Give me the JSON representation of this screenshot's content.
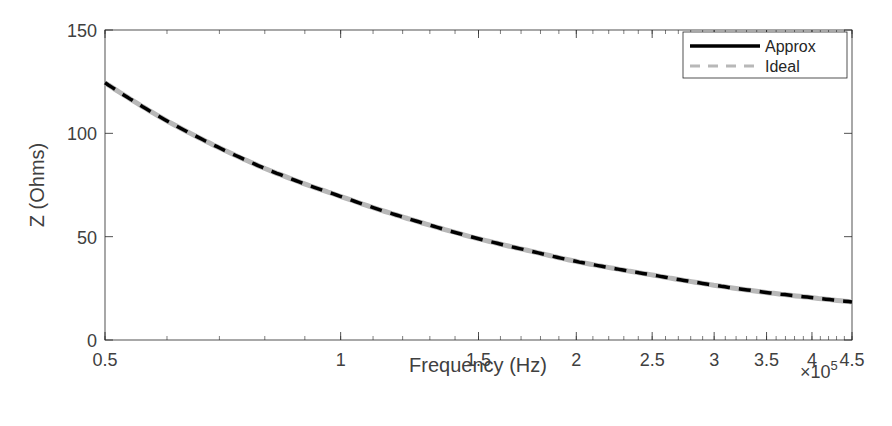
{
  "chart_data": {
    "type": "line",
    "title": "",
    "xlabel": "Frequency (Hz)",
    "ylabel": "Z (Ohms)",
    "x_scale": "log",
    "x_multiplier": "×10^5",
    "xlim": [
      0.5,
      4.5
    ],
    "ylim": [
      0,
      150
    ],
    "x_ticks": [
      0.5,
      1,
      1.5,
      2,
      2.5,
      3,
      3.5,
      4,
      4.5
    ],
    "x_tick_labels": [
      "0.5",
      "1",
      "1.5",
      "2",
      "2.5",
      "3",
      "3.5",
      "4",
      "4.5"
    ],
    "y_ticks": [
      0,
      50,
      100,
      150
    ],
    "y_tick_labels": [
      "0",
      "50",
      "100",
      "150"
    ],
    "grid": false,
    "legend_position": "upper right",
    "x": [
      0.5,
      0.6,
      0.7,
      0.8,
      0.9,
      1.0,
      1.25,
      1.5,
      1.75,
      2.0,
      2.5,
      3.0,
      3.5,
      4.0,
      4.5
    ],
    "series": [
      {
        "name": "Approx",
        "style": "solid",
        "color": "#000000",
        "values": [
          124.5,
          106,
          93,
          83,
          75.5,
          69.5,
          57.5,
          49,
          43,
          38,
          31.5,
          26.5,
          23,
          20.5,
          18.4
        ]
      },
      {
        "name": "Ideal",
        "style": "dashed",
        "color": "#b8b8b8",
        "values": [
          124.5,
          106,
          93,
          83,
          75.5,
          69.5,
          57.5,
          49,
          43,
          38,
          31.5,
          26.5,
          23,
          20.5,
          18.4
        ]
      }
    ]
  },
  "axes": {
    "xlabel": "Frequency (Hz)",
    "ylabel": "Z (Ohms)",
    "multiplier_base": "×10",
    "multiplier_exp": "5"
  },
  "legend": {
    "items": [
      {
        "label": "Approx"
      },
      {
        "label": "Ideal"
      }
    ]
  }
}
